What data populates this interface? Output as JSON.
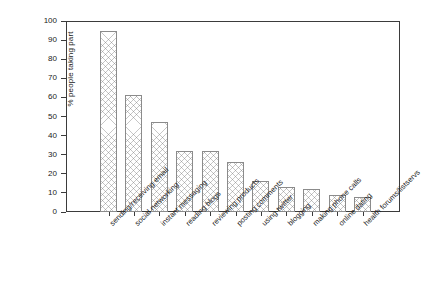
{
  "chart_data": {
    "type": "bar",
    "title": "",
    "xlabel": "",
    "ylabel": "% people taking part",
    "ylim": [
      0,
      100
    ],
    "yticks": [
      0,
      10,
      20,
      30,
      40,
      50,
      60,
      70,
      80,
      90,
      100
    ],
    "grid": false,
    "legend": "none",
    "bar_fill": "crosshatch",
    "bar_edge_color": "#8b8b8b",
    "frame_color": "#3b3b3b",
    "background": "#ffffff",
    "categories": [
      "sending/receiving email",
      "social networking",
      "instant messaging",
      "reading blogs",
      "reviewing products",
      "posting comments",
      "using twitter",
      "blogging",
      "making phone calls",
      "online dating",
      "health forums/listservs"
    ],
    "values": [
      95,
      61,
      47,
      32,
      32,
      26,
      16,
      13,
      12,
      9,
      8
    ]
  }
}
